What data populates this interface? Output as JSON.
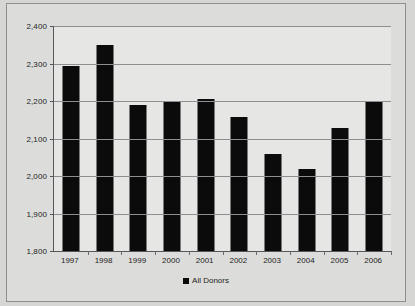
{
  "chart_data": {
    "type": "bar",
    "title": "",
    "subtitle": "",
    "xlabel": "",
    "ylabel": "",
    "categories": [
      "1997",
      "1998",
      "1999",
      "2000",
      "2001",
      "2002",
      "2003",
      "2004",
      "2005",
      "2006"
    ],
    "series": [
      {
        "name": "All Donors",
        "color": "#0b0b0b",
        "values": [
          2293,
          2350,
          2190,
          2201,
          2205,
          2158,
          2058,
          2018,
          2128,
          2197
        ]
      }
    ],
    "ylim": [
      1800,
      2400
    ],
    "yticks": [
      1800,
      1900,
      2000,
      2100,
      2200,
      2300,
      2400
    ],
    "ytick_labels": [
      "1,800",
      "1,900",
      "2,000",
      "2,100",
      "2,200",
      "2,300",
      "2,400"
    ],
    "grid": true,
    "legend_position": "bottom",
    "legend_entries": [
      "All Donors"
    ]
  },
  "legend": {
    "marker": "square-marker",
    "label": "All Donors"
  },
  "colors": {
    "bar": "#0b0b0b",
    "grid": "#8f8f93",
    "axis": "#55555a",
    "plot_background": "#e6e6e4",
    "figure_background": "#dcdcda",
    "page_background": "#d6d6d4",
    "text": "#232323"
  }
}
